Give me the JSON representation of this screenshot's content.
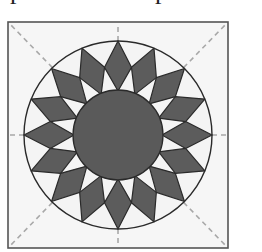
{
  "figure": {
    "cropped_top_text": [
      "p",
      "p"
    ],
    "square": {
      "x": 8,
      "y": 22,
      "width": 220,
      "height": 226
    },
    "center": {
      "x": 118,
      "y": 135
    },
    "outer_radius": 94,
    "inner_radius": 45,
    "diamond_mid_radius": 69,
    "petal_count": 16,
    "colors": {
      "background": "#f6f6f6",
      "petal_fill": "#5c5c5c",
      "center_fill": "#5a5a5a",
      "light_fill": "#f4f4f4",
      "outline": "#2a2a2a",
      "guide_dash": "#a8a8a8",
      "frame": "#555555"
    }
  }
}
